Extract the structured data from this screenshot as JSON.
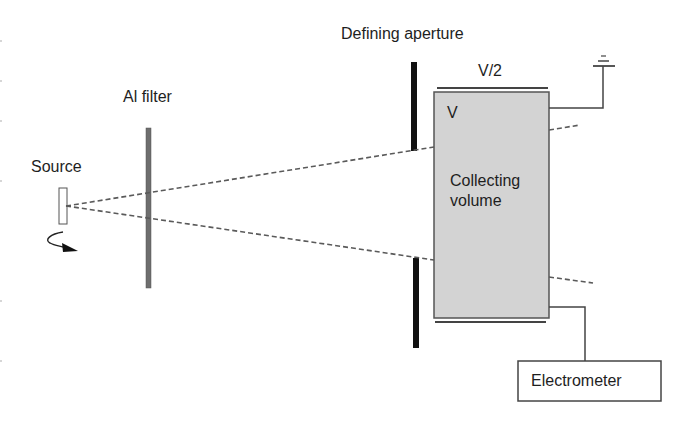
{
  "diagram": {
    "title": "",
    "labels": {
      "source": "Source",
      "filter": "Al filter",
      "aperture": "Defining aperture",
      "plate_potential": "V/2",
      "volume_potential": "V",
      "collecting_volume_line1": "Collecting",
      "collecting_volume_line2": "volume",
      "electrometer": "Electrometer"
    },
    "components": [
      {
        "id": "source",
        "type": "rect",
        "label": "Source"
      },
      {
        "id": "rotation-arrow",
        "type": "curved-arrow"
      },
      {
        "id": "al-filter",
        "type": "bar",
        "label": "Al filter"
      },
      {
        "id": "defining-aperture",
        "type": "split-bar",
        "label": "Defining aperture"
      },
      {
        "id": "collecting-volume",
        "type": "box",
        "label": "Collecting volume"
      },
      {
        "id": "ground",
        "type": "ground-symbol"
      },
      {
        "id": "electrometer",
        "type": "box",
        "label": "Electrometer"
      }
    ],
    "colors": {
      "line": "#4a4a4a",
      "dash": "#5a5a5a",
      "filter": "#6e6e6e",
      "aperture": "#111111",
      "volume_fill": "#d3d3d3",
      "background": "#ffffff"
    }
  }
}
